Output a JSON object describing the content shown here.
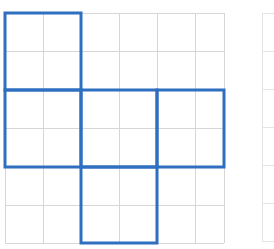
{
  "figure": {
    "background_color": "#ffffff",
    "canvas": {
      "width": 274,
      "height": 249
    }
  },
  "chart_data": {
    "type": "diagram",
    "xlabel": "",
    "ylabel": "",
    "grid": true,
    "legend": "none",
    "annotations": [],
    "grid_spec": {
      "columns": 6,
      "rows": 6,
      "cell_size_px": 38,
      "origin_x_px": 5,
      "origin_y_px": 13,
      "line_color": "#d6d6d6",
      "line_width_px": 1,
      "x_tick_positions_px": [
        5,
        43,
        81,
        119,
        157,
        195,
        224
      ],
      "y_tick_positions_px": [
        13,
        51,
        90,
        128,
        167,
        205,
        243
      ]
    },
    "secondary_grid_spec": {
      "columns": 1,
      "rows": 6,
      "origin_x_px": 262,
      "origin_y_px": 13,
      "width_px": 12,
      "cell_size_px": 38,
      "line_color": "#e4e4e4",
      "line_width_px": 1
    },
    "shape": {
      "name": "pentomino-net",
      "stroke_color": "#2f6fbf",
      "stroke_width_px": 3,
      "fill": "none",
      "unit_cells_per_square": 2,
      "square_size_px": 76,
      "squares": [
        {
          "id": "square-top-left",
          "col": 0,
          "row": 0,
          "x_px": 5,
          "y_px": 13,
          "w_px": 76,
          "h_px": 77
        },
        {
          "id": "square-middle-left",
          "col": 0,
          "row": 2,
          "x_px": 5,
          "y_px": 90,
          "w_px": 76,
          "h_px": 77
        },
        {
          "id": "square-middle-center",
          "col": 2,
          "row": 2,
          "x_px": 81,
          "y_px": 90,
          "w_px": 76,
          "h_px": 77
        },
        {
          "id": "square-middle-right",
          "col": 4,
          "row": 2,
          "x_px": 157,
          "y_px": 90,
          "w_px": 67,
          "h_px": 77
        },
        {
          "id": "square-bottom-center",
          "col": 2,
          "row": 4,
          "x_px": 81,
          "y_px": 167,
          "w_px": 76,
          "h_px": 76
        }
      ]
    }
  }
}
